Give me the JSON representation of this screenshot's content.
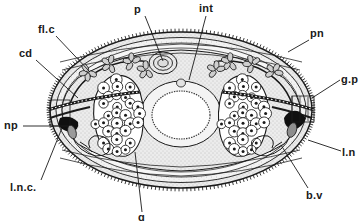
{
  "figure": {
    "organism_view": "transverse-section",
    "style": "line-drawing-stipple",
    "ink_color": "#1a1a1a",
    "background_color": "#ffffff",
    "fill_color": "#e8e8e8"
  },
  "labels": [
    {
      "id": "p",
      "text": "p",
      "x": 134,
      "y": 4,
      "anchor_x": 145,
      "anchor_y": 16,
      "tip_x": 163,
      "tip_y": 61
    },
    {
      "id": "int",
      "text": "int",
      "x": 199,
      "y": 3,
      "anchor_x": 206,
      "anchor_y": 16,
      "tip_x": 189,
      "tip_y": 80
    },
    {
      "id": "fl_c",
      "text": "fl.c",
      "x": 38,
      "y": 24,
      "anchor_x": 56,
      "anchor_y": 36,
      "tip_x": 90,
      "tip_y": 72
    },
    {
      "id": "pn",
      "text": "pn",
      "x": 310,
      "y": 28,
      "anchor_x": 309,
      "anchor_y": 40,
      "tip_x": 288,
      "tip_y": 52
    },
    {
      "id": "cd",
      "text": "cd",
      "x": 19,
      "y": 48,
      "anchor_x": 36,
      "anchor_y": 60,
      "tip_x": 78,
      "tip_y": 98
    },
    {
      "id": "g_p",
      "text": "g.p",
      "x": 341,
      "y": 74,
      "anchor_x": 340,
      "anchor_y": 80,
      "tip_x": 312,
      "tip_y": 98
    },
    {
      "id": "np",
      "text": "np",
      "x": 4,
      "y": 120,
      "anchor_x": 23,
      "anchor_y": 126,
      "tip_x": 68,
      "tip_y": 126
    },
    {
      "id": "l_n",
      "text": "l.n",
      "x": 342,
      "y": 147,
      "anchor_x": 341,
      "anchor_y": 151,
      "tip_x": 308,
      "tip_y": 140
    },
    {
      "id": "l_n_c",
      "text": "l.n.c.",
      "x": 10,
      "y": 182,
      "anchor_x": 41,
      "anchor_y": 180,
      "tip_x": 62,
      "tip_y": 128
    },
    {
      "id": "b_v",
      "text": "b.v",
      "x": 306,
      "y": 190,
      "anchor_x": 308,
      "anchor_y": 188,
      "tip_x": 281,
      "tip_y": 145
    },
    {
      "id": "g",
      "text": "g",
      "x": 138,
      "y": 212,
      "anchor_x": 142,
      "anchor_y": 212,
      "tip_x": 135,
      "tip_y": 152
    }
  ],
  "structures": [
    {
      "id": "cuticle",
      "name": "cuticle-spiny-outline"
    },
    {
      "id": "body-wall",
      "name": "body-wall-muscle-layer"
    },
    {
      "id": "parenchyma",
      "name": "parenchyma-stipple"
    },
    {
      "id": "intestine",
      "name": "intestine-lumen"
    },
    {
      "id": "gonad-left",
      "name": "gonad-germinal-cells-left"
    },
    {
      "id": "gonad-right",
      "name": "gonad-germinal-cells-right"
    },
    {
      "id": "nerve-cord-l",
      "name": "lateral-nerve-cord-left"
    },
    {
      "id": "nerve-cord-r",
      "name": "lateral-nerve-cord-right"
    },
    {
      "id": "flame-cells",
      "name": "flame-cell-cluster"
    },
    {
      "id": "protonephridia",
      "name": "protonephridial-ducts"
    },
    {
      "id": "genital-pore",
      "name": "genital-pore"
    },
    {
      "id": "nephridiopore",
      "name": "nephridiopore"
    }
  ]
}
